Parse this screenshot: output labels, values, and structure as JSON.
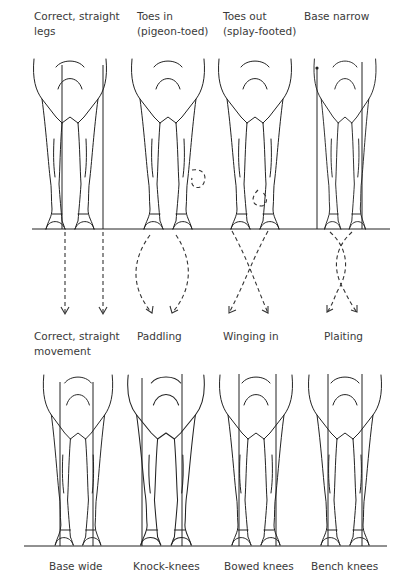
{
  "figure": {
    "row1": {
      "labels": [
        {
          "line1": "Correct, straight",
          "line2": "legs"
        },
        {
          "line1": "Toes in",
          "line2": "(pigeon-toed)"
        },
        {
          "line1": "Toes out",
          "line2": "(splay-footed)"
        },
        {
          "line1": "Base narrow",
          "line2": ""
        }
      ]
    },
    "movement": {
      "labels": [
        {
          "line1": "Correct, straight",
          "line2": "movement"
        },
        {
          "line1": "Paddling",
          "line2": ""
        },
        {
          "line1": "Winging in",
          "line2": ""
        },
        {
          "line1": "Plaiting",
          "line2": ""
        }
      ]
    },
    "row2": {
      "labels": [
        {
          "line1": "Base wide"
        },
        {
          "line1": "Knock-knees"
        },
        {
          "line1": "Bowed knees"
        },
        {
          "line1": "Bench knees"
        }
      ]
    },
    "colors": {
      "ink": "#222222",
      "text": "#3a3a3a",
      "background": "#ffffff"
    }
  }
}
